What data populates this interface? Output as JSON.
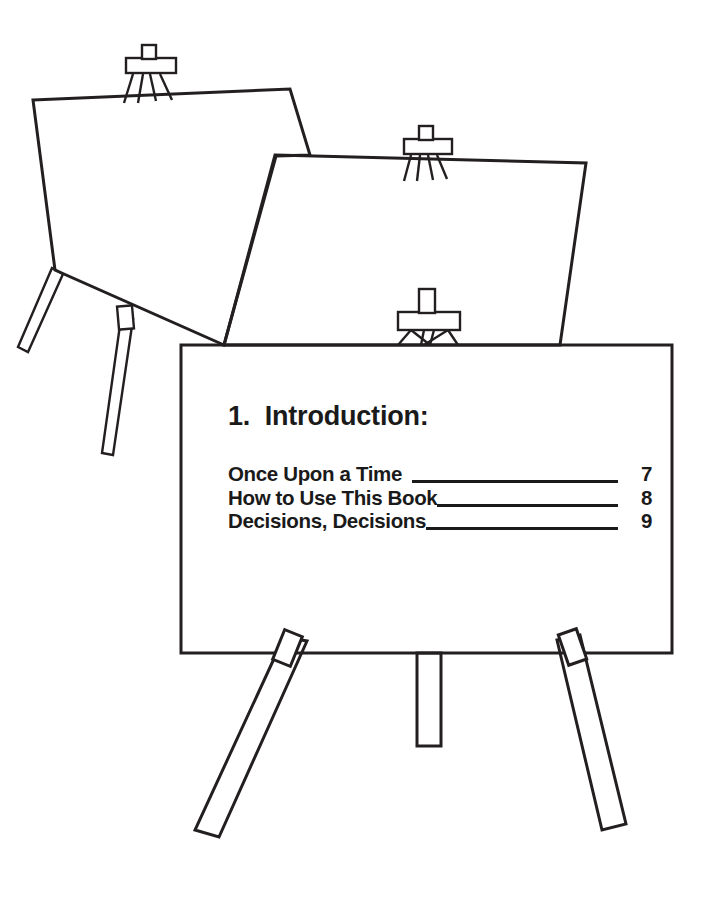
{
  "page": {
    "background_color": "#ffffff",
    "ink_color": "#231f20",
    "text_color": "#1a1a1a"
  },
  "illustration": {
    "name": "three-easels-with-blank-boards",
    "easel_count": 3,
    "easels": [
      {
        "label": "back-easel",
        "board_state": "blank"
      },
      {
        "label": "middle-easel",
        "board_state": "blank"
      },
      {
        "label": "front-easel",
        "board_state": "table-of-contents"
      }
    ]
  },
  "toc": {
    "heading": "1.  Introduction:",
    "entries": [
      {
        "title": "Once Upon a Time",
        "page": "7"
      },
      {
        "title": "How to Use This Book",
        "page": "8"
      },
      {
        "title": "Decisions, Decisions",
        "page": "9"
      }
    ]
  }
}
